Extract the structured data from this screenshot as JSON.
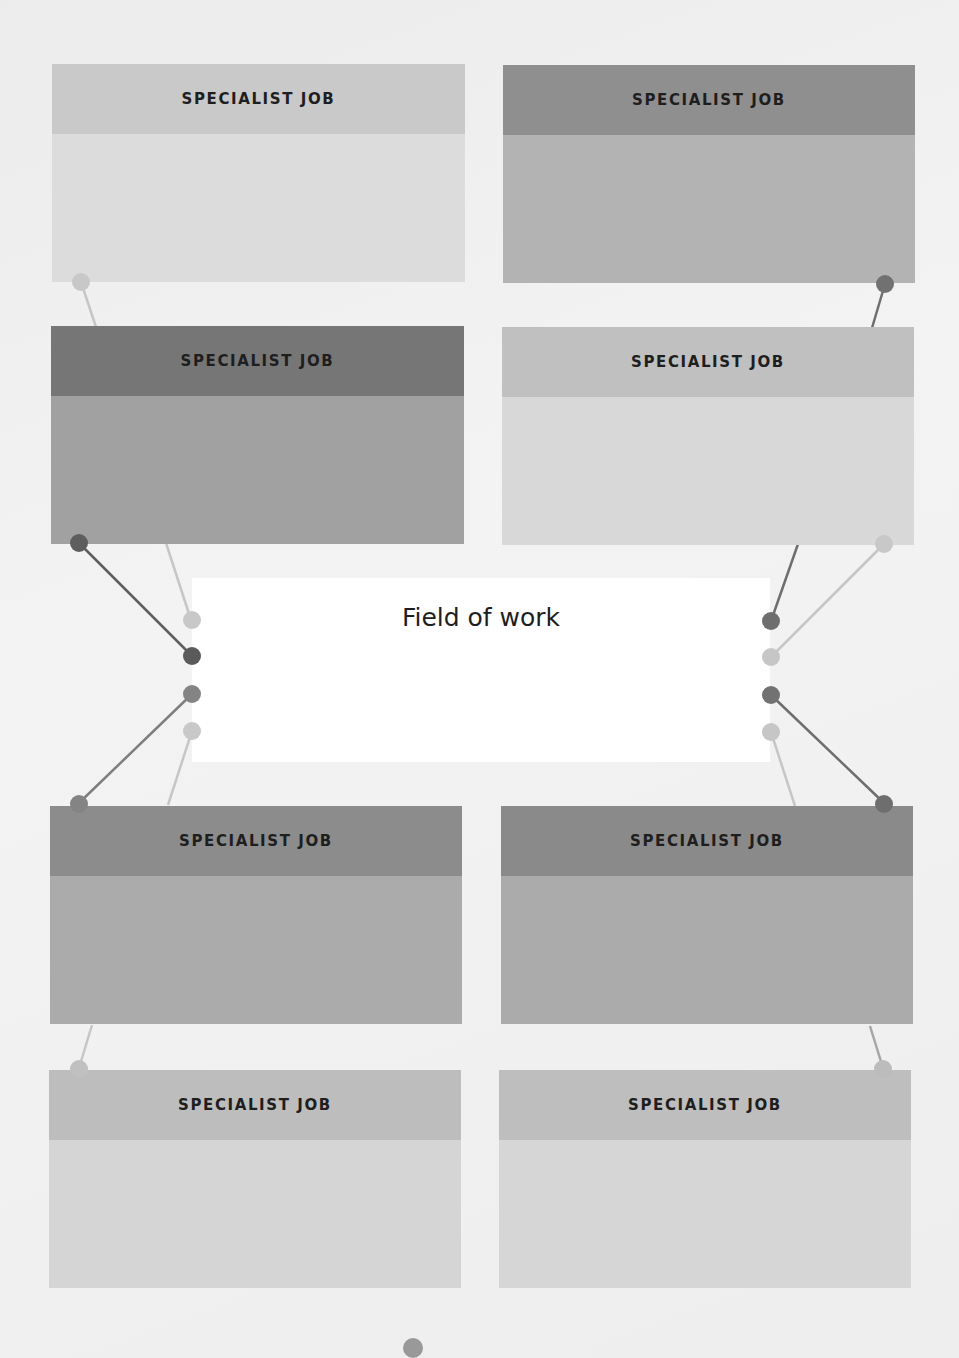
{
  "palette": {
    "background": "#efefef",
    "light_header": "#c4c4c4",
    "light_body": "#d9d9d9",
    "mid_header": "#8e8e8e",
    "mid_body": "#aeaeae",
    "dark_header": "#7a7a7a",
    "dark_body": "#a0a0a0",
    "dot_light": "#c6c6c6",
    "dot_mid": "#8a8a8a",
    "dot_dark": "#6e6e6e"
  },
  "center": {
    "title": "Field of work"
  },
  "cards": [
    {
      "id": "top-left-1",
      "label": "SPECIALIST JOB",
      "tone": "light"
    },
    {
      "id": "top-right-1",
      "label": "SPECIALIST JOB",
      "tone": "mid"
    },
    {
      "id": "top-left-2",
      "label": "SPECIALIST JOB",
      "tone": "dark"
    },
    {
      "id": "top-right-2",
      "label": "SPECIALIST JOB",
      "tone": "light"
    },
    {
      "id": "bottom-left-1",
      "label": "SPECIALIST JOB",
      "tone": "mid"
    },
    {
      "id": "bottom-right-1",
      "label": "SPECIALIST JOB",
      "tone": "mid"
    },
    {
      "id": "bottom-left-2",
      "label": "SPECIALIST JOB",
      "tone": "light"
    },
    {
      "id": "bottom-right-2",
      "label": "SPECIALIST JOB",
      "tone": "light"
    }
  ]
}
